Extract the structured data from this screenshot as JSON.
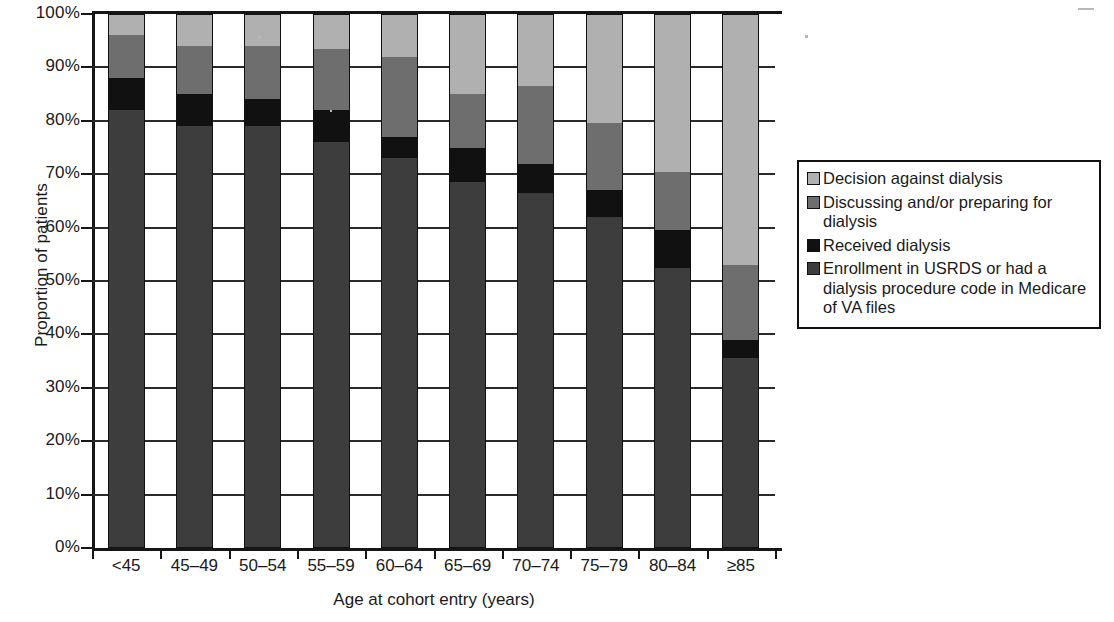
{
  "chart_data": {
    "type": "bar",
    "subtype": "stacked-bar-100",
    "title": "",
    "xlabel": "Age at cohort entry (years)",
    "ylabel": "Proportion of patients",
    "ylim": [
      0,
      100
    ],
    "ytick_labels": [
      "0%",
      "10%",
      "20%",
      "30%",
      "40%",
      "50%",
      "60%",
      "70%",
      "80%",
      "90%",
      "100%"
    ],
    "ytick_values": [
      0,
      10,
      20,
      30,
      40,
      50,
      60,
      70,
      80,
      90,
      100
    ],
    "grid": true,
    "legend_position": "right",
    "categories": [
      "<45",
      "45–49",
      "50–54",
      "55–59",
      "60–64",
      "65–69",
      "70–74",
      "75–79",
      "80–84",
      "≥85"
    ],
    "series": [
      {
        "name": "Enrollment in USRDS or had a dialysis procedure code in Medicare of VA files",
        "color": "#3d3d3d",
        "values": [
          82,
          79,
          79,
          76,
          73,
          68.5,
          66.5,
          62,
          52.5,
          35.5
        ]
      },
      {
        "name": "Received dialysis",
        "color": "#111111",
        "values": [
          6,
          6,
          5,
          6,
          4,
          6.5,
          5.5,
          5,
          7,
          3.5
        ]
      },
      {
        "name": "Discussing and/or preparing for dialysis",
        "color": "#6e6e6e",
        "values": [
          8,
          9,
          10,
          11.5,
          15,
          10,
          14.5,
          12.5,
          11,
          14
        ]
      },
      {
        "name": "Decision against dialysis",
        "color": "#b0b0b0",
        "values": [
          4,
          6,
          6,
          6.5,
          8,
          15,
          13.5,
          20.5,
          29.5,
          47
        ]
      }
    ]
  },
  "legend": {
    "items": [
      {
        "label": "Decision against dialysis",
        "color": "#b0b0b0",
        "key": "decision-against-dialysis"
      },
      {
        "label": "Discussing and/or preparing for dialysis",
        "color": "#6e6e6e",
        "key": "discussing-preparing-dialysis"
      },
      {
        "label": "Received dialysis",
        "color": "#111111",
        "key": "received-dialysis"
      },
      {
        "label": "Enrollment in USRDS or had a dialysis procedure code in Medicare of VA files",
        "color": "#3d3d3d",
        "key": "enrollment-usrds"
      }
    ]
  }
}
